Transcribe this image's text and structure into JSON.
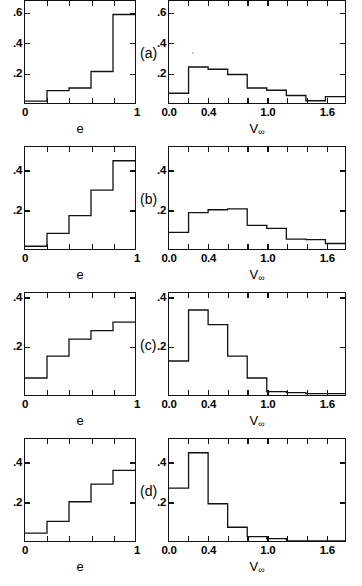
{
  "figure": {
    "background": "#ffffff",
    "ink": "#111111",
    "panel_tags": [
      "(a)",
      "(b)",
      "(c)",
      "(d)"
    ]
  },
  "axes": {
    "e_title": "e",
    "v_title_base": "V",
    "v_title_sub": "∞",
    "e_xticks": [
      "0",
      "1"
    ],
    "v_xticks": [
      "0.0",
      "0.4",
      "1.0",
      "1.6"
    ],
    "yticks_3": [
      ".2",
      ".4",
      ".6"
    ],
    "yticks_2": [
      ".2",
      ".4"
    ]
  },
  "chart_data": [
    {
      "type": "bar",
      "panel": "(a)",
      "side": "left",
      "title": "",
      "xlabel": "e",
      "ylabel": "",
      "xlim": [
        0,
        1
      ],
      "ylim": [
        0,
        0.68
      ],
      "grid": false,
      "legend": "none",
      "bin_edges": [
        0,
        0.2,
        0.4,
        0.6,
        0.8,
        1.0
      ],
      "categories": [
        "0.0-0.2",
        "0.2-0.4",
        "0.4-0.6",
        "0.6-0.8",
        "0.8-1.0"
      ],
      "values": [
        0.012,
        0.082,
        0.1,
        0.21,
        0.59
      ],
      "xtick_values": [
        0,
        1
      ],
      "xtick_labels": [
        "0",
        "1"
      ],
      "ytick_values": [
        0.2,
        0.4,
        0.6
      ],
      "ytick_labels": [
        ".2",
        ".4",
        ".6"
      ]
    },
    {
      "type": "bar",
      "panel": "(a)",
      "side": "right",
      "title": "",
      "xlabel": "V∞",
      "ylabel": "",
      "xlim": [
        0,
        1.8
      ],
      "ylim": [
        0,
        0.68
      ],
      "grid": false,
      "legend": "none",
      "bin_edges": [
        0,
        0.2,
        0.4,
        0.6,
        0.8,
        1.0,
        1.2,
        1.4,
        1.6,
        1.8
      ],
      "categories": [
        "0.0-0.2",
        "0.2-0.4",
        "0.4-0.6",
        "0.6-0.8",
        "0.8-1.0",
        "1.0-1.2",
        "1.2-1.4",
        "1.4-1.6",
        "1.6-1.8"
      ],
      "values": [
        0.065,
        0.24,
        0.225,
        0.19,
        0.1,
        0.085,
        0.05,
        0.015,
        0.042
      ],
      "xtick_values": [
        0.0,
        0.4,
        1.0,
        1.6
      ],
      "xtick_labels": [
        "0.0",
        "0.4",
        "1.0",
        "1.6"
      ],
      "ytick_values": [
        0.2,
        0.4,
        0.6
      ],
      "ytick_labels": [
        ".2",
        ".4",
        ".6"
      ]
    },
    {
      "type": "bar",
      "panel": "(b)",
      "side": "left",
      "title": "",
      "xlabel": "e",
      "ylabel": "",
      "xlim": [
        0,
        1
      ],
      "ylim": [
        0,
        0.52
      ],
      "grid": false,
      "legend": "none",
      "bin_edges": [
        0,
        0.2,
        0.4,
        0.6,
        0.8,
        1.0
      ],
      "categories": [
        "0.0-0.2",
        "0.2-0.4",
        "0.4-0.6",
        "0.6-0.8",
        "0.8-1.0"
      ],
      "values": [
        0.014,
        0.08,
        0.17,
        0.3,
        0.45
      ],
      "xtick_values": [
        0,
        1
      ],
      "xtick_labels": [
        "0",
        "1"
      ],
      "ytick_values": [
        0.2,
        0.4
      ],
      "ytick_labels": [
        ".2",
        ".4"
      ]
    },
    {
      "type": "bar",
      "panel": "(b)",
      "side": "right",
      "title": "",
      "xlabel": "V∞",
      "ylabel": "",
      "xlim": [
        0,
        1.8
      ],
      "ylim": [
        0,
        0.52
      ],
      "grid": false,
      "legend": "none",
      "bin_edges": [
        0,
        0.2,
        0.4,
        0.6,
        0.8,
        1.0,
        1.2,
        1.4,
        1.6,
        1.8
      ],
      "categories": [
        "0.0-0.2",
        "0.2-0.4",
        "0.4-0.6",
        "0.6-0.8",
        "0.8-1.0",
        "1.0-1.2",
        "1.2-1.4",
        "1.4-1.6",
        "1.6-1.8"
      ],
      "values": [
        0.085,
        0.185,
        0.2,
        0.205,
        0.12,
        0.105,
        0.05,
        0.048,
        0.028
      ],
      "xtick_values": [
        0.0,
        0.4,
        1.0,
        1.6
      ],
      "xtick_labels": [
        "0.0",
        "0.4",
        "1.0",
        "1.6"
      ],
      "ytick_values": [
        0.2,
        0.4
      ],
      "ytick_labels": [
        ".2",
        ".4"
      ]
    },
    {
      "type": "bar",
      "panel": "(c)",
      "side": "left",
      "title": "",
      "xlabel": "e",
      "ylabel": "",
      "xlim": [
        0,
        1
      ],
      "ylim": [
        0,
        0.42
      ],
      "grid": false,
      "legend": "none",
      "bin_edges": [
        0,
        0.2,
        0.4,
        0.6,
        0.8,
        1.0
      ],
      "categories": [
        "0.0-0.2",
        "0.2-0.4",
        "0.4-0.6",
        "0.6-0.8",
        "0.8-1.0"
      ],
      "values": [
        0.07,
        0.16,
        0.23,
        0.265,
        0.3
      ],
      "xtick_values": [
        0,
        1
      ],
      "xtick_labels": [
        "0",
        "1"
      ],
      "ytick_values": [
        0.2,
        0.4
      ],
      "ytick_labels": [
        ".2",
        ".4"
      ]
    },
    {
      "type": "bar",
      "panel": "(c)",
      "side": "right",
      "title": "",
      "xlabel": "V∞",
      "ylabel": "",
      "xlim": [
        0,
        1.8
      ],
      "ylim": [
        0,
        0.42
      ],
      "grid": false,
      "legend": "none",
      "bin_edges": [
        0,
        0.2,
        0.4,
        0.6,
        0.8,
        1.0,
        1.2,
        1.4,
        1.6,
        1.8
      ],
      "categories": [
        "0.0-0.2",
        "0.2-0.4",
        "0.4-0.6",
        "0.6-0.8",
        "0.8-1.0",
        "1.0-1.2",
        "1.2-1.4",
        "1.4-1.6",
        "1.6-1.8"
      ],
      "values": [
        0.14,
        0.35,
        0.29,
        0.16,
        0.07,
        0.014,
        0.01,
        0.006,
        0.006
      ],
      "xtick_values": [
        0.0,
        0.4,
        1.0,
        1.6
      ],
      "xtick_labels": [
        "0.0",
        "0.4",
        "1.0",
        "1.6"
      ],
      "ytick_values": [
        0.2,
        0.4
      ],
      "ytick_labels": [
        ".2",
        ".4"
      ]
    },
    {
      "type": "bar",
      "panel": "(d)",
      "side": "left",
      "title": "",
      "xlabel": "e",
      "ylabel": "",
      "xlim": [
        0,
        1
      ],
      "ylim": [
        0,
        0.52
      ],
      "grid": false,
      "legend": "none",
      "bin_edges": [
        0,
        0.2,
        0.4,
        0.6,
        0.8,
        1.0
      ],
      "categories": [
        "0.0-0.2",
        "0.2-0.4",
        "0.4-0.6",
        "0.6-0.8",
        "0.8-1.0"
      ],
      "values": [
        0.04,
        0.1,
        0.2,
        0.29,
        0.36
      ],
      "xtick_values": [
        0,
        1
      ],
      "xtick_labels": [
        "0",
        "1"
      ],
      "ytick_values": [
        0.2,
        0.4
      ],
      "ytick_labels": [
        ".2",
        ".4"
      ]
    },
    {
      "type": "bar",
      "panel": "(d)",
      "side": "right",
      "title": "",
      "xlabel": "V∞",
      "ylabel": "",
      "xlim": [
        0,
        1.8
      ],
      "ylim": [
        0,
        0.52
      ],
      "grid": false,
      "legend": "none",
      "bin_edges": [
        0,
        0.2,
        0.4,
        0.6,
        0.8,
        1.0,
        1.2,
        1.4,
        1.6,
        1.8
      ],
      "categories": [
        "0.0-0.2",
        "0.2-0.4",
        "0.4-0.6",
        "0.6-0.8",
        "0.8-1.0",
        "1.0-1.2",
        "1.2-1.4",
        "1.4-1.6",
        "1.6-1.8"
      ],
      "values": [
        0.27,
        0.45,
        0.19,
        0.07,
        0.022,
        0.012,
        0.0,
        0.0,
        0.0
      ],
      "xtick_values": [
        0.0,
        0.4,
        1.0,
        1.6
      ],
      "xtick_labels": [
        "0.0",
        "0.4",
        "1.0",
        "1.6"
      ],
      "ytick_values": [
        0.2,
        0.4
      ],
      "ytick_labels": [
        ".2",
        ".4"
      ]
    }
  ]
}
